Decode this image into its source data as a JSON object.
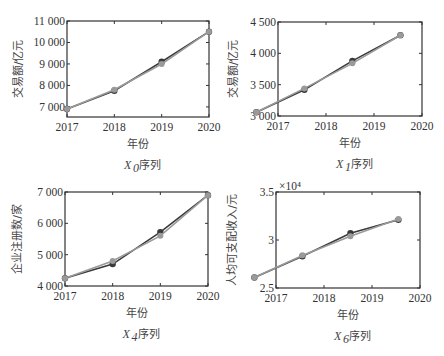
{
  "chart_data": [
    {
      "type": "line",
      "title": "X0 序列",
      "title_var": "X",
      "title_sub": "0",
      "title_suffix": "序列",
      "xlabel": "年份",
      "ylabel": "交易额/亿元",
      "x_ticks": [
        "2017",
        "2018",
        "2019",
        "2020"
      ],
      "y_ticks": [
        "7 000",
        "8 000",
        "9 000",
        "10 000",
        "11 000"
      ],
      "xlim": [
        2017,
        2020
      ],
      "ylim": [
        6530,
        11000
      ],
      "x": [
        2017,
        2018,
        2019,
        2020
      ],
      "series": [
        {
          "name": "实际值",
          "values": [
            6900,
            7750,
            9100,
            10500
          ]
        },
        {
          "name": "预测值",
          "values": [
            6900,
            7800,
            9000,
            10500
          ]
        }
      ]
    },
    {
      "type": "line",
      "title": "X1 序列",
      "title_var": "X",
      "title_sub": "1",
      "title_suffix": "序列",
      "xlabel": "年份",
      "ylabel": "交易额/亿元",
      "x_ticks": [
        "2017",
        "2018",
        "2019",
        "2020"
      ],
      "y_ticks": [
        "3 000",
        "3 500",
        "4 000",
        "4 500"
      ],
      "xlim": [
        2017,
        2020
      ],
      "ylim": [
        3000,
        4500
      ],
      "x": [
        2016.55,
        2017.55,
        2018.55,
        2019.55
      ],
      "series": [
        {
          "name": "实际值",
          "values": [
            3060,
            3420,
            3880,
            4290
          ]
        },
        {
          "name": "预测值",
          "values": [
            3060,
            3440,
            3840,
            4290
          ]
        }
      ]
    },
    {
      "type": "line",
      "title": "X4 序列",
      "title_var": "X",
      "title_sub": "4",
      "title_suffix": "序列",
      "xlabel": "年份",
      "ylabel": "企业注册数/家",
      "x_ticks": [
        "2017",
        "2018",
        "2019",
        "2020"
      ],
      "y_ticks": [
        "4 000",
        "5 000",
        "6 000",
        "7 000"
      ],
      "xlim": [
        2017,
        2020
      ],
      "ylim": [
        4000,
        7000
      ],
      "x": [
        2017,
        2018,
        2019,
        2020
      ],
      "series": [
        {
          "name": "实际值",
          "values": [
            4250,
            4700,
            5720,
            6900
          ]
        },
        {
          "name": "预测值",
          "values": [
            4250,
            4800,
            5600,
            6900
          ]
        }
      ]
    },
    {
      "type": "line",
      "title": "X6 序列",
      "title_var": "X",
      "title_sub": "6",
      "title_suffix": "序列",
      "xlabel": "年份",
      "ylabel": "人均可支配收入/元",
      "y_multiplier": "×10⁴",
      "x_ticks": [
        "2017",
        "2018",
        "2019",
        "2020"
      ],
      "y_ticks": [
        "2.5",
        "3",
        "3.5"
      ],
      "xlim": [
        2017,
        2020
      ],
      "ylim": [
        2.5,
        3.5
      ],
      "x": [
        2016.55,
        2017.55,
        2018.55,
        2019.55
      ],
      "series": [
        {
          "name": "实际值",
          "values": [
            2.61,
            2.83,
            3.07,
            3.21
          ]
        },
        {
          "name": "预测值",
          "values": [
            2.61,
            2.84,
            3.04,
            3.22
          ]
        }
      ]
    }
  ],
  "panels": [
    {
      "left": 67,
      "right": 209,
      "top": 21,
      "bottom": 117,
      "ylab_x": 22
    },
    {
      "left": 278,
      "right": 422,
      "top": 22,
      "bottom": 116,
      "ylab_x": 237
    },
    {
      "left": 65,
      "right": 208,
      "top": 192,
      "bottom": 286,
      "ylab_x": 21
    },
    {
      "left": 276,
      "right": 420,
      "top": 192,
      "bottom": 288,
      "ylab_x": 236
    }
  ],
  "colors": {
    "actual": "#3a3a3a",
    "predicted": "#9a9a9a",
    "axis": "#333333"
  }
}
